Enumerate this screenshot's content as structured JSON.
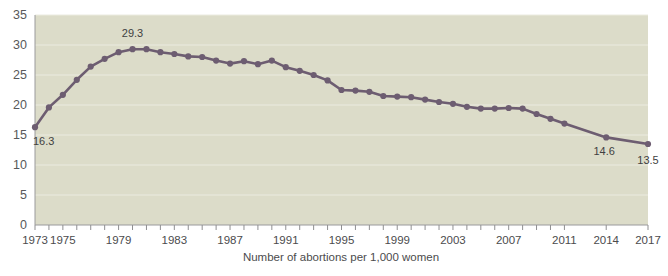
{
  "chart_data": {
    "type": "line",
    "title": "",
    "subtitle": "",
    "xlabel": "Number of abortions per 1,000 women",
    "ylabel": "",
    "ylim": [
      0,
      35
    ],
    "xlim": [
      1973,
      2017
    ],
    "grid": true,
    "legend": null,
    "y_ticks": [
      0,
      5,
      10,
      15,
      20,
      25,
      30,
      35
    ],
    "x_tick_labels": [
      "1973",
      "1975",
      "1979",
      "1983",
      "1987",
      "1991",
      "1995",
      "1999",
      "2003",
      "2007",
      "2011",
      "2014",
      "2017"
    ],
    "x_tick_values": [
      1973,
      1975,
      1979,
      1983,
      1987,
      1991,
      1995,
      1999,
      2003,
      2007,
      2011,
      2014,
      2017
    ],
    "x_minor_tick_values": [
      1973,
      1974,
      1975,
      1976,
      1977,
      1978,
      1979,
      1980,
      1981,
      1982,
      1983,
      1984,
      1985,
      1986,
      1987,
      1988,
      1989,
      1990,
      1991,
      1992,
      1993,
      1994,
      1995,
      1996,
      1997,
      1998,
      1999,
      2000,
      2001,
      2002,
      2003,
      2004,
      2005,
      2006,
      2007,
      2008,
      2009,
      2010,
      2011,
      2014,
      2017
    ],
    "x": [
      1973,
      1974,
      1975,
      1976,
      1977,
      1978,
      1979,
      1980,
      1981,
      1982,
      1983,
      1984,
      1985,
      1986,
      1987,
      1988,
      1989,
      1990,
      1991,
      1992,
      1993,
      1994,
      1995,
      1996,
      1997,
      1998,
      1999,
      2000,
      2001,
      2002,
      2003,
      2004,
      2005,
      2006,
      2007,
      2008,
      2009,
      2010,
      2011,
      2014,
      2017
    ],
    "values": [
      16.3,
      19.6,
      21.7,
      24.2,
      26.4,
      27.7,
      28.8,
      29.3,
      29.3,
      28.8,
      28.5,
      28.1,
      28.0,
      27.4,
      26.9,
      27.3,
      26.8,
      27.4,
      26.3,
      25.7,
      25.0,
      24.1,
      22.5,
      22.4,
      22.2,
      21.5,
      21.4,
      21.3,
      20.9,
      20.5,
      20.2,
      19.7,
      19.4,
      19.4,
      19.5,
      19.4,
      18.5,
      17.7,
      16.9,
      14.6,
      13.5
    ],
    "annotated_points": [
      {
        "x": 1973,
        "value": "16.3",
        "dx": -2,
        "dy": 18,
        "anchor": "start"
      },
      {
        "x": 1980,
        "value": "29.3",
        "dx": 0,
        "dy": -12,
        "anchor": "middle"
      },
      {
        "x": 2014,
        "value": "14.6",
        "dx": -2,
        "dy": 18,
        "anchor": "middle"
      },
      {
        "x": 2017,
        "value": "13.5",
        "dx": 0,
        "dy": 20,
        "anchor": "middle"
      }
    ],
    "colors": {
      "line": "#6d5d71",
      "marker": "#6d5d71",
      "plot_background": "#dcdcc9",
      "gridline": "#ebebe0",
      "axis": "#9a9a9c",
      "tick_text": "#58585a",
      "page_background": "#ffffff"
    }
  }
}
